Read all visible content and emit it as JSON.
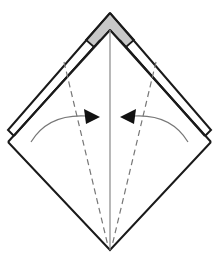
{
  "diagram": {
    "type": "origami-fold-step",
    "colors": {
      "background": "#ffffff",
      "outline": "#1a1a1a",
      "back_layer_fill": "#c8c8c8",
      "center_line": "#888888",
      "dashed_fold": "#777777",
      "arrow_curve": "#777777",
      "arrow_head": "#111111"
    },
    "elements": [
      {
        "name": "kite-base-shape",
        "kind": "outline"
      },
      {
        "name": "back-layer-tip",
        "kind": "gray-fill"
      },
      {
        "name": "center-crease",
        "kind": "solid-line"
      },
      {
        "name": "left-valley-fold-line",
        "kind": "dashed-line"
      },
      {
        "name": "right-valley-fold-line",
        "kind": "dashed-line"
      },
      {
        "name": "left-fold-arrow",
        "kind": "arrow",
        "direction": "right"
      },
      {
        "name": "right-fold-arrow",
        "kind": "arrow",
        "direction": "left"
      }
    ]
  }
}
